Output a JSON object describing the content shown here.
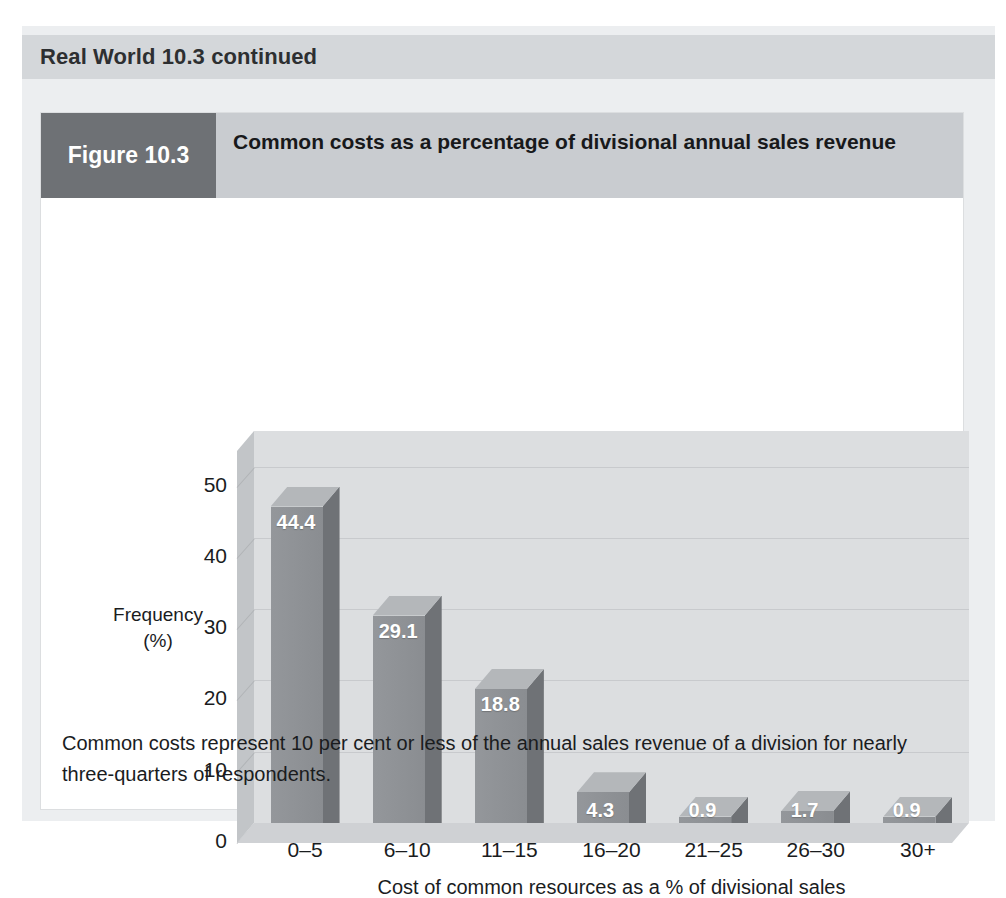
{
  "banner": {
    "title": "Real World 10.3 continued"
  },
  "figure": {
    "tag": "Figure 10.3",
    "title": "Common costs as a percentage of divisional annual sales revenue",
    "caption": "Common costs represent 10 per cent or less of the annual sales revenue of a division for nearly three-quarters of respondents."
  },
  "colors": {
    "panel": "#eceef0",
    "banner": "#d4d7da",
    "figure_tag": "#6e7175",
    "figure_header": "#c9ccd0",
    "bar_front": "#8e9195",
    "bar_side": "#6f7276",
    "bar_top": "#b4b7ba",
    "wall_back": "#dcdee0",
    "wall_left": "#c2c5c8",
    "floor": "#cfd1d4"
  },
  "chart_data": {
    "type": "bar",
    "title": "Common costs as a percentage of divisional annual sales revenue",
    "categories": [
      "0–5",
      "6–10",
      "11–15",
      "16–20",
      "21–25",
      "26–30",
      "30+"
    ],
    "values": [
      44.4,
      29.1,
      18.8,
      4.3,
      0.9,
      1.7,
      0.9
    ],
    "labels": [
      "44.4",
      "29.1",
      "18.8",
      "4.3",
      "0.9",
      "1.7",
      "0.9"
    ],
    "xlabel": "Cost of common resources as a % of divisional sales",
    "ylabel": "Frequency (%)",
    "ylabel_line1": "Frequency",
    "ylabel_line2": "(%)",
    "yticks": [
      "0",
      "10",
      "20",
      "30",
      "40",
      "50"
    ],
    "ytick_values": [
      0,
      10,
      20,
      30,
      40,
      50
    ],
    "ylim": [
      0,
      55
    ],
    "grid": true,
    "legend": "none",
    "style": "3d-column"
  }
}
